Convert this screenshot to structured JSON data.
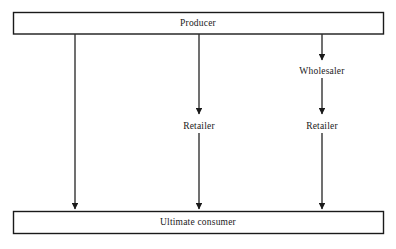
{
  "diagram": {
    "type": "flow-diagram",
    "stroke_color": "#1a1a1a",
    "background_color": "#ffffff",
    "nodes": {
      "producer": {
        "label": "Producer",
        "shape": "rectangle",
        "x": 198,
        "y": 23
      },
      "wholesaler": {
        "label": "Wholesaler",
        "shape": "text",
        "x": 322,
        "y": 71
      },
      "retailer_middle": {
        "label": "Retailer",
        "shape": "text",
        "x": 199,
        "y": 126
      },
      "retailer_right": {
        "label": "Retailer",
        "shape": "text",
        "x": 322,
        "y": 126
      },
      "ultimate_consumer": {
        "label": "Ultimate consumer",
        "shape": "rectangle",
        "x": 198,
        "y": 222
      }
    },
    "channels": [
      {
        "name": "direct",
        "path": "Producer → Ultimate consumer",
        "column_x": 75
      },
      {
        "name": "one-level",
        "path": "Producer → Retailer → Ultimate consumer",
        "column_x": 199
      },
      {
        "name": "two-level",
        "path": "Producer → Wholesaler → Retailer → Ultimate consumer",
        "column_x": 322
      }
    ]
  }
}
